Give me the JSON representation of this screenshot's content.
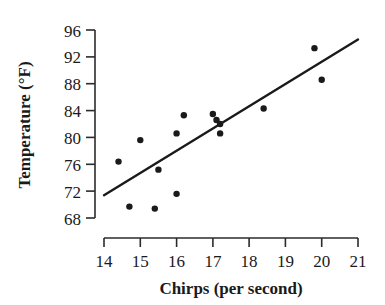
{
  "chart_data": {
    "type": "scatter",
    "title": "",
    "xlabel": "Chirps (per second)",
    "ylabel": "Temperature (°F)",
    "xlim": [
      14,
      21
    ],
    "ylim": [
      68,
      96
    ],
    "xticks": [
      14,
      15,
      16,
      17,
      18,
      19,
      20,
      21
    ],
    "yticks": [
      68,
      72,
      76,
      80,
      84,
      88,
      92,
      96
    ],
    "xtick_labels": [
      "14",
      "15",
      "16",
      "17",
      "18",
      "19",
      "20",
      "21"
    ],
    "ytick_labels": [
      "68",
      "72",
      "76",
      "80",
      "84",
      "88",
      "92",
      "96"
    ],
    "grid": false,
    "legend": null,
    "series": [
      {
        "name": "Observations",
        "type": "scatter",
        "marker": "circle",
        "color": "#1a1a1a",
        "points": [
          {
            "x": 14.4,
            "y": 76.4
          },
          {
            "x": 14.7,
            "y": 69.7
          },
          {
            "x": 15.0,
            "y": 79.6
          },
          {
            "x": 15.4,
            "y": 69.4
          },
          {
            "x": 15.5,
            "y": 75.2
          },
          {
            "x": 16.0,
            "y": 71.6
          },
          {
            "x": 16.0,
            "y": 80.6
          },
          {
            "x": 16.2,
            "y": 83.3
          },
          {
            "x": 17.0,
            "y": 83.5
          },
          {
            "x": 17.1,
            "y": 82.6
          },
          {
            "x": 17.2,
            "y": 82.0
          },
          {
            "x": 17.2,
            "y": 80.6
          },
          {
            "x": 18.4,
            "y": 84.3
          },
          {
            "x": 19.8,
            "y": 93.3
          },
          {
            "x": 20.0,
            "y": 88.6
          }
        ]
      },
      {
        "name": "Fitted line",
        "type": "line",
        "color": "#1a1a1a",
        "endpoints": [
          {
            "x": 14.0,
            "y": 71.4
          },
          {
            "x": 21.0,
            "y": 94.6
          }
        ]
      }
    ]
  },
  "axes": {
    "x_title": "Chirps (per second)",
    "y_title": "Temperature (°F)"
  }
}
